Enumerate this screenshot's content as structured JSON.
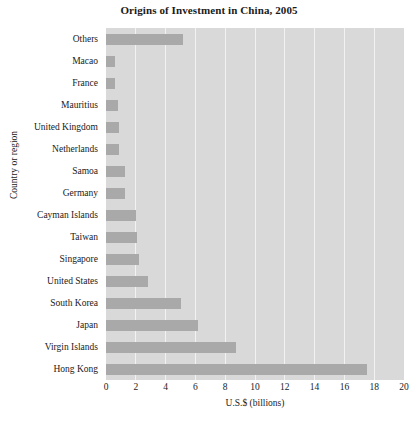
{
  "chart_data": {
    "type": "bar",
    "orientation": "horizontal",
    "title": "Origins of Investment in China, 2005",
    "xlabel": "U.S.$ (billions)",
    "ylabel": "Country or region",
    "xlim": [
      0,
      20
    ],
    "xticks": [
      0,
      2,
      4,
      6,
      8,
      10,
      12,
      14,
      16,
      18,
      20
    ],
    "xtick_labels": [
      "0",
      "2",
      "4",
      "6",
      "8",
      "10",
      "12",
      "14",
      "16",
      "18",
      "20"
    ],
    "grid": "vertical-white",
    "legend": "none",
    "categories": [
      "Others",
      "Macao",
      "France",
      "Mauritius",
      "United Kingdom",
      "Netherlands",
      "Samoa",
      "Germany",
      "Cayman Islands",
      "Taiwan",
      "Singapore",
      "United States",
      "South Korea",
      "Japan",
      "Virgin Islands",
      "Hong Kong"
    ],
    "values": [
      5.2,
      0.6,
      0.6,
      0.8,
      0.9,
      0.9,
      1.3,
      1.3,
      2.0,
      2.1,
      2.2,
      2.8,
      5.0,
      6.2,
      8.7,
      17.5
    ],
    "colors": {
      "bar": "#a9a9a9",
      "plot_background": "#d9d9d9",
      "gridline": "#f2f2f2",
      "page_background": "#ffffff",
      "text": "#1a1a1a"
    }
  }
}
